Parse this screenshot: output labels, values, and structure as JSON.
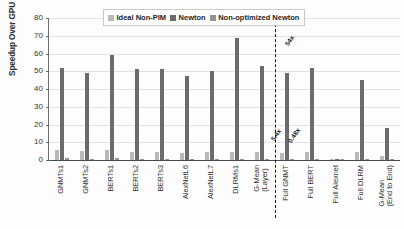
{
  "chart_data": {
    "type": "bar",
    "title": "",
    "xlabel": "",
    "ylabel": "Speedup Over GPU",
    "ylim": [
      0,
      80
    ],
    "ytick_step": 10,
    "yticks": [
      0,
      10,
      20,
      30,
      40,
      50,
      60,
      70,
      80
    ],
    "grid": true,
    "legend_position": "top-center",
    "legend": [
      "Ideal Non-PIM",
      "Newton",
      "Non-optimized Newton"
    ],
    "categories": [
      "GNMTs1",
      "GNMTs2",
      "BERTs1",
      "BERTs2",
      "BERTs3",
      "AlexNetL6",
      "AlexNetL7",
      "DLRMs1",
      "G-Mean (Layer)",
      "Full GNMT",
      "Full BERT",
      "Full Alexnet",
      "Full DLRM",
      "G-Mean (End to End)"
    ],
    "category_lines": [
      [
        "GNMTs1"
      ],
      [
        "GNMTs2"
      ],
      [
        "BERTs1"
      ],
      [
        "BERTs2"
      ],
      [
        "BERTs3"
      ],
      [
        "AlexNetL6"
      ],
      [
        "AlexNetL7"
      ],
      [
        "DLRMs1"
      ],
      [
        "G-Mean",
        "(Layer)"
      ],
      [
        "Full GNMT"
      ],
      [
        "Full BERT"
      ],
      [
        "Full Alexnet"
      ],
      [
        "Full DLRM"
      ],
      [
        "G-Mean",
        "(End to End)"
      ]
    ],
    "series": [
      {
        "name": "Ideal Non-PIM",
        "color": "#b9b9b9",
        "values": [
          5.4,
          4.8,
          5.6,
          4.7,
          4.4,
          4.1,
          4.4,
          4.7,
          4.3,
          4.1,
          4.4,
          0.35,
          4.6,
          2.3
        ]
      },
      {
        "name": "Newton",
        "color": "#6b6b6b",
        "values": [
          52.0,
          48.8,
          59.0,
          51.5,
          51.5,
          47.6,
          50.1,
          69.0,
          53.0,
          49.0,
          52.0,
          0.5,
          45.3,
          18.0
        ]
      },
      {
        "name": "Non-optimized Newton",
        "color": "#949494",
        "values": [
          0.9,
          0.85,
          0.9,
          0.7,
          0.7,
          0.55,
          0.8,
          0.55,
          0.55,
          0.6,
          0.6,
          0.45,
          0.6,
          0.6
        ]
      }
    ],
    "annotations": [
      {
        "text": "5.4x",
        "category": "G-Mean (Layer)",
        "series": "Ideal Non-PIM"
      },
      {
        "text": "54x",
        "category": "G-Mean (Layer)",
        "series": "Newton"
      },
      {
        "text": "0.48x",
        "category": "G-Mean (Layer)",
        "series": "Non-optimized Newton"
      }
    ],
    "divider": {
      "after_category": "G-Mean (Layer)",
      "style": "dashed",
      "color": "#151515"
    }
  }
}
